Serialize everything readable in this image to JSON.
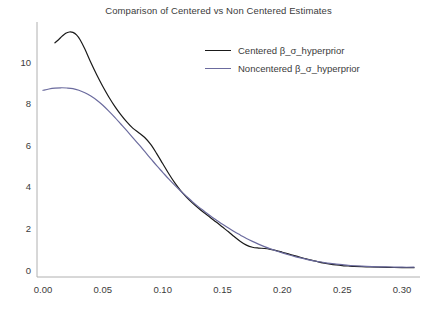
{
  "chart_data": {
    "type": "line",
    "title": "Comparison of Centered vs Non Centered Estimates",
    "xlabel": "",
    "ylabel": "",
    "xlim": [
      -0.005,
      0.315
    ],
    "ylim": [
      -0.35,
      11.9
    ],
    "xticks": [
      0.0,
      0.05,
      0.1,
      0.15,
      0.2,
      0.25,
      0.3
    ],
    "xticklabels": [
      "0.00",
      "0.05",
      "0.10",
      "0.15",
      "0.20",
      "0.25",
      "0.30"
    ],
    "yticks": [
      0,
      2,
      4,
      6,
      8,
      10
    ],
    "yticklabels": [
      "0",
      "2",
      "4",
      "6",
      "8",
      "10"
    ],
    "grid": false,
    "legend_position": "upper right",
    "legend_frame": false,
    "background": "#ffffff",
    "spines": [
      "left",
      "bottom"
    ],
    "series": [
      {
        "name": "Centered β_σ_hyperprior",
        "color": "#1a1a1a",
        "linewidth": 1.2,
        "x": [
          0.01,
          0.013,
          0.016,
          0.019,
          0.022,
          0.025,
          0.028,
          0.031,
          0.035,
          0.04,
          0.045,
          0.05,
          0.055,
          0.06,
          0.065,
          0.07,
          0.075,
          0.08,
          0.085,
          0.09,
          0.095,
          0.1,
          0.105,
          0.11,
          0.115,
          0.12,
          0.125,
          0.13,
          0.135,
          0.14,
          0.145,
          0.15,
          0.155,
          0.16,
          0.165,
          0.17,
          0.175,
          0.18,
          0.185,
          0.19,
          0.195,
          0.2,
          0.205,
          0.21,
          0.215,
          0.22,
          0.225,
          0.23,
          0.235,
          0.24,
          0.245,
          0.25,
          0.255,
          0.26,
          0.27,
          0.28,
          0.29,
          0.3,
          0.31
        ],
        "y": [
          10.9,
          11.05,
          11.22,
          11.36,
          11.42,
          11.4,
          11.28,
          11.05,
          10.6,
          9.95,
          9.35,
          8.8,
          8.3,
          7.85,
          7.45,
          7.1,
          6.8,
          6.58,
          6.35,
          6.02,
          5.58,
          5.1,
          4.62,
          4.18,
          3.8,
          3.48,
          3.2,
          2.95,
          2.72,
          2.5,
          2.28,
          2.05,
          1.82,
          1.58,
          1.36,
          1.18,
          1.08,
          1.04,
          1.02,
          0.98,
          0.92,
          0.84,
          0.76,
          0.68,
          0.6,
          0.52,
          0.45,
          0.38,
          0.32,
          0.27,
          0.23,
          0.2,
          0.18,
          0.16,
          0.14,
          0.12,
          0.11,
          0.1,
          0.1
        ]
      },
      {
        "name": "Noncentered β_σ_hyperprior",
        "color": "#6b6b9e",
        "linewidth": 1.2,
        "x": [
          0.0,
          0.005,
          0.01,
          0.015,
          0.02,
          0.025,
          0.03,
          0.035,
          0.04,
          0.045,
          0.05,
          0.055,
          0.06,
          0.065,
          0.07,
          0.075,
          0.08,
          0.085,
          0.09,
          0.095,
          0.1,
          0.105,
          0.11,
          0.115,
          0.12,
          0.125,
          0.13,
          0.135,
          0.14,
          0.145,
          0.15,
          0.155,
          0.16,
          0.165,
          0.17,
          0.175,
          0.18,
          0.185,
          0.19,
          0.195,
          0.2,
          0.205,
          0.21,
          0.215,
          0.22,
          0.225,
          0.23,
          0.235,
          0.24,
          0.245,
          0.25,
          0.255,
          0.26,
          0.27,
          0.28,
          0.29,
          0.3,
          0.31
        ],
        "y": [
          8.62,
          8.68,
          8.72,
          8.74,
          8.73,
          8.7,
          8.62,
          8.5,
          8.34,
          8.14,
          7.9,
          7.62,
          7.32,
          7.0,
          6.68,
          6.35,
          6.02,
          5.68,
          5.34,
          5.0,
          4.68,
          4.36,
          4.06,
          3.78,
          3.52,
          3.26,
          3.02,
          2.8,
          2.58,
          2.38,
          2.18,
          2.0,
          1.82,
          1.66,
          1.5,
          1.36,
          1.23,
          1.11,
          1.0,
          0.9,
          0.81,
          0.72,
          0.64,
          0.57,
          0.5,
          0.44,
          0.39,
          0.34,
          0.3,
          0.27,
          0.24,
          0.21,
          0.19,
          0.16,
          0.14,
          0.13,
          0.12,
          0.12
        ]
      }
    ]
  },
  "axes": {
    "tick_color": "#3b3b3b",
    "spine_color": "#b0b0b0"
  }
}
